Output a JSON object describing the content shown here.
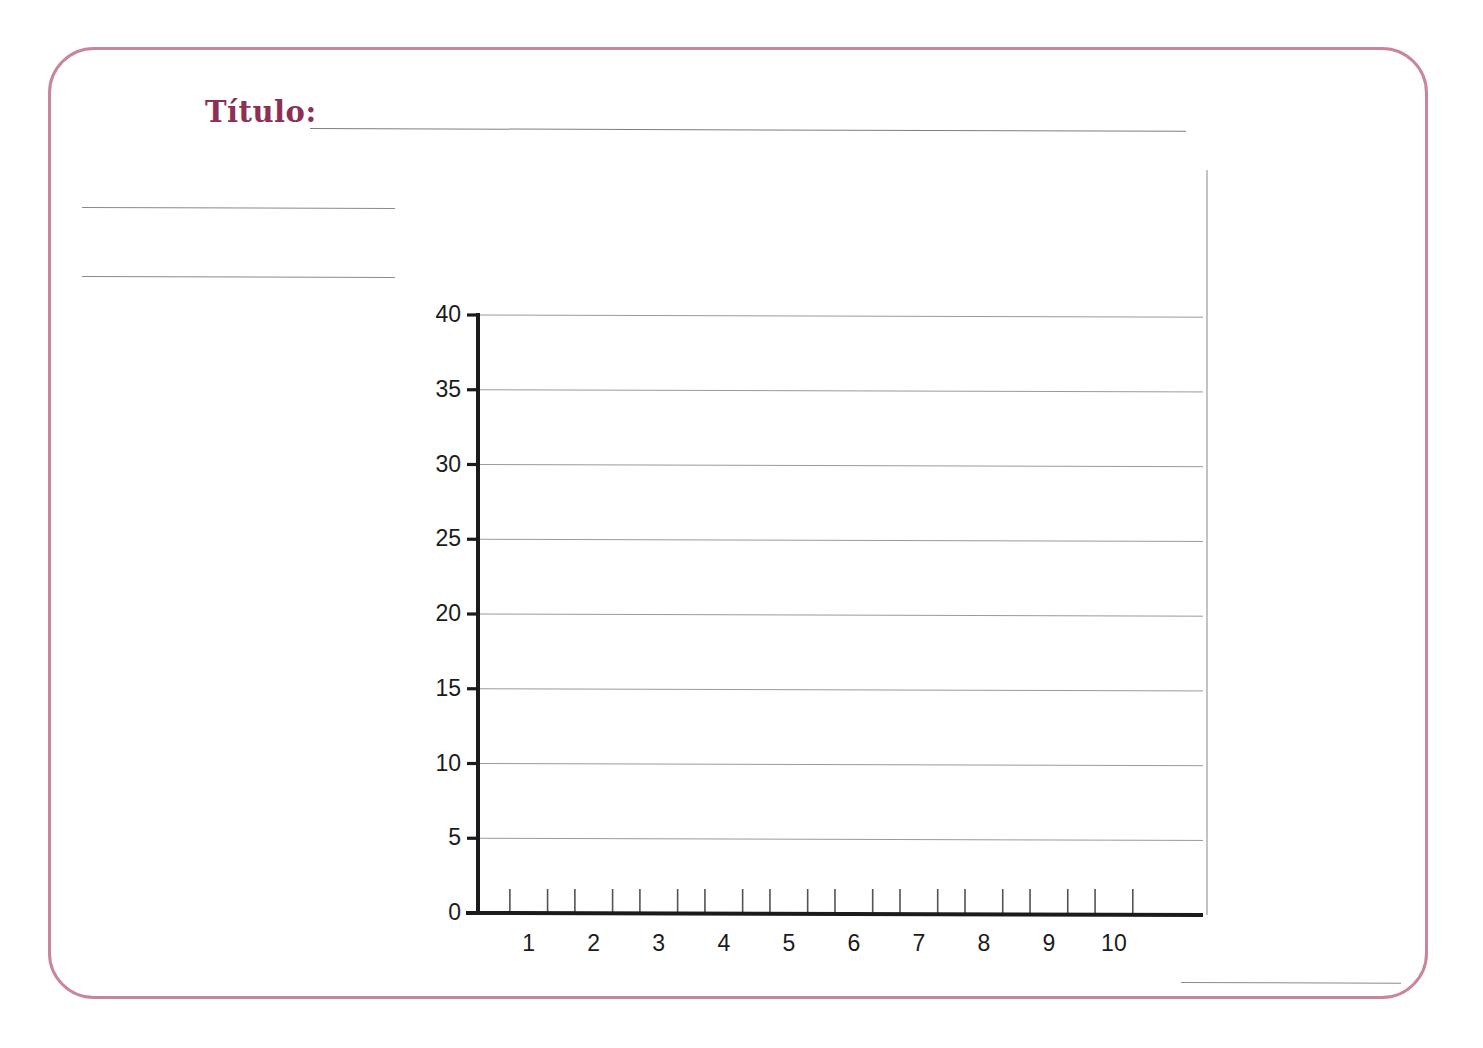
{
  "document": {
    "kind": "blank-chart-worksheet",
    "language": "es"
  },
  "header": {
    "title_label": "Título:",
    "title_value": "",
    "title_color": "#8e2f55"
  },
  "frame": {
    "border_color": "#c9849f"
  },
  "notes": {
    "line_1_value": "",
    "line_2_value": "",
    "footer_line_value": ""
  },
  "chart_data": {
    "type": "bar",
    "title": "",
    "subtitle": "",
    "xlabel": "",
    "ylabel": "",
    "categories": [
      "1",
      "2",
      "3",
      "4",
      "5",
      "6",
      "7",
      "8",
      "9",
      "10"
    ],
    "values": [
      0,
      0,
      0,
      0,
      0,
      0,
      0,
      0,
      0,
      0
    ],
    "series": [
      {
        "name": "",
        "values": [
          0,
          0,
          0,
          0,
          0,
          0,
          0,
          0,
          0,
          0
        ]
      }
    ],
    "x_tick_labels": [
      "1",
      "2",
      "3",
      "4",
      "5",
      "6",
      "7",
      "8",
      "9",
      "10"
    ],
    "y_tick_labels": [
      "0",
      "5",
      "10",
      "15",
      "20",
      "25",
      "30",
      "35",
      "40"
    ],
    "y_ticks": [
      0,
      5,
      10,
      15,
      20,
      25,
      30,
      35,
      40
    ],
    "ylim": [
      0,
      40
    ],
    "y_step": 5,
    "grid": true,
    "grid_axis": "y",
    "grid_color": "#9a9a9e",
    "axis_color": "#1b1b1b",
    "legend": false,
    "legend_position": "none",
    "empty": true,
    "annotations": []
  },
  "plot_geometry": {
    "left": 478,
    "right": 1203,
    "top": 315,
    "bottom": 913,
    "right_edge_line_top": 170
  }
}
